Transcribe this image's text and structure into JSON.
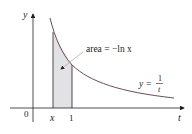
{
  "diagram": {
    "axes": {
      "y_label": "y",
      "x_label": "t",
      "origin_label": "0"
    },
    "ticks": {
      "x_point_label": "x",
      "one_label": "1"
    },
    "annotation": {
      "area_label": "area = −ln x"
    },
    "curve": {
      "eq_lhs": "y =",
      "eq_num": "1",
      "eq_den": "t"
    },
    "colors": {
      "curve": "#6b4c5a",
      "axes": "#231f20",
      "shade": "#e2e2e4",
      "arrow": "#b0b0b0"
    }
  }
}
